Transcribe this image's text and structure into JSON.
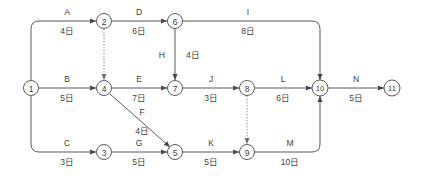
{
  "diagram": {
    "type": "arrow-diagram-network",
    "duration_unit": "日",
    "nodes": [
      {
        "id": "1",
        "label": "①",
        "text": "1",
        "x": 31,
        "y": 88
      },
      {
        "id": "2",
        "label": "②",
        "text": "2",
        "x": 104,
        "y": 21
      },
      {
        "id": "3",
        "label": "③",
        "text": "3",
        "x": 104,
        "y": 152
      },
      {
        "id": "4",
        "label": "④",
        "text": "4",
        "x": 104,
        "y": 88
      },
      {
        "id": "5",
        "label": "⑤",
        "text": "5",
        "x": 175,
        "y": 152
      },
      {
        "id": "6",
        "label": "⑥",
        "text": "6",
        "x": 175,
        "y": 21
      },
      {
        "id": "7",
        "label": "⑦",
        "text": "7",
        "x": 175,
        "y": 88
      },
      {
        "id": "8",
        "label": "⑧",
        "text": "8",
        "x": 247,
        "y": 88
      },
      {
        "id": "9",
        "label": "⑨",
        "text": "9",
        "x": 247,
        "y": 152
      },
      {
        "id": "10",
        "label": "⑩",
        "text": "10",
        "x": 320,
        "y": 88
      },
      {
        "id": "11",
        "label": "⑪",
        "text": "11",
        "x": 392,
        "y": 88
      }
    ],
    "activities": [
      {
        "id": "A",
        "name": "A",
        "duration": "4日",
        "days": 4,
        "from": "1",
        "to": "2",
        "label_x": 67,
        "name_y": 15,
        "dur_y": 34,
        "dummy": false
      },
      {
        "id": "B",
        "name": "B",
        "duration": "5日",
        "days": 5,
        "from": "1",
        "to": "4",
        "label_x": 67,
        "name_y": 82,
        "dur_y": 101,
        "dummy": false
      },
      {
        "id": "C",
        "name": "C",
        "duration": "3日",
        "days": 3,
        "from": "1",
        "to": "3",
        "label_x": 67,
        "name_y": 146,
        "dur_y": 165,
        "dummy": false
      },
      {
        "id": "D",
        "name": "D",
        "duration": "6日",
        "days": 6,
        "from": "2",
        "to": "6",
        "label_x": 139,
        "name_y": 15,
        "dur_y": 34,
        "dummy": false
      },
      {
        "id": "E",
        "name": "E",
        "duration": "7日",
        "days": 7,
        "from": "4",
        "to": "7",
        "label_x": 139,
        "name_y": 82,
        "dur_y": 101,
        "dummy": false
      },
      {
        "id": "F",
        "name": "F",
        "duration": "4日",
        "days": 4,
        "from": "4",
        "to": "5",
        "label_x": 142,
        "name_y": 115,
        "dur_y": 134,
        "dummy": false
      },
      {
        "id": "G",
        "name": "G",
        "duration": "5日",
        "days": 5,
        "from": "3",
        "to": "5",
        "label_x": 139,
        "name_y": 146,
        "dur_y": 165,
        "dummy": false
      },
      {
        "id": "H",
        "name": "H",
        "duration": "4日",
        "days": 4,
        "from": "6",
        "to": "7",
        "label_x": 165,
        "name_y": 58,
        "dur_y": 58,
        "dummy": false
      },
      {
        "id": "I",
        "name": "I",
        "duration": "8日",
        "days": 8,
        "from": "6",
        "to": "10",
        "label_x": 248,
        "name_y": 15,
        "dur_y": 34,
        "dummy": false
      },
      {
        "id": "J",
        "name": "J",
        "duration": "3日",
        "days": 3,
        "from": "7",
        "to": "8",
        "label_x": 211,
        "name_y": 82,
        "dur_y": 101,
        "dummy": false
      },
      {
        "id": "K",
        "name": "K",
        "duration": "5日",
        "days": 5,
        "from": "5",
        "to": "9",
        "label_x": 211,
        "name_y": 146,
        "dur_y": 165,
        "dummy": false
      },
      {
        "id": "L",
        "name": "L",
        "duration": "6日",
        "days": 6,
        "from": "8",
        "to": "10",
        "label_x": 283,
        "name_y": 82,
        "dur_y": 101,
        "dummy": false
      },
      {
        "id": "M",
        "name": "M",
        "duration": "10日",
        "days": 10,
        "from": "9",
        "to": "10",
        "label_x": 290,
        "name_y": 146,
        "dur_y": 165,
        "dummy": false
      },
      {
        "id": "N",
        "name": "N",
        "duration": "5日",
        "days": 5,
        "from": "10",
        "to": "11",
        "label_x": 356,
        "name_y": 82,
        "dur_y": 101,
        "dummy": false
      },
      {
        "id": "dummy-2-4",
        "name": "",
        "duration": "",
        "days": 0,
        "from": "2",
        "to": "4",
        "label_x": 0,
        "name_y": 0,
        "dur_y": 0,
        "dummy": true
      },
      {
        "id": "dummy-8-9",
        "name": "",
        "duration": "",
        "days": 0,
        "from": "8",
        "to": "9",
        "label_x": 0,
        "name_y": 0,
        "dur_y": 0,
        "dummy": true
      }
    ],
    "colors": {
      "line": "#5a5a5a",
      "dummy_line": "#8c8c8c",
      "text": "#3d3d3d",
      "background": "#ffffff"
    }
  }
}
